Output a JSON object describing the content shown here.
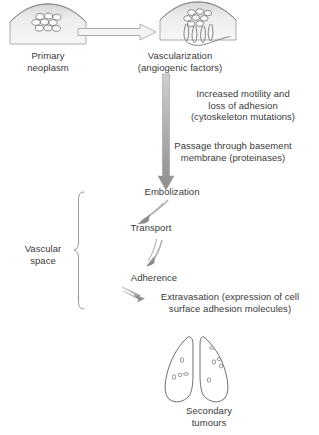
{
  "diagram": {
    "title_context": "Metastatic cascade",
    "nodes": [
      {
        "id": "primary-neoplasm",
        "label": "Primary\nneoplasm",
        "x": 8,
        "y": 50,
        "w": 80
      },
      {
        "id": "vascularization",
        "label": "Vascularization\n(angiogenic factors)",
        "x": 110,
        "y": 50,
        "w": 140
      },
      {
        "id": "increased-motility",
        "label": "Increased motility and\nloss of adhesion\n(cytoskeleton mutations)",
        "x": 168,
        "y": 88,
        "w": 150
      },
      {
        "id": "passage-basement",
        "label": "Passage through basement\nmembrane (proteinases)",
        "x": 148,
        "y": 140,
        "w": 170
      },
      {
        "id": "embolization",
        "label": "Embolization",
        "x": 122,
        "y": 186,
        "w": 100
      },
      {
        "id": "transport",
        "label": "Transport",
        "x": 110,
        "y": 222,
        "w": 82
      },
      {
        "id": "vascular-space",
        "label": "Vascular\nspace",
        "x": 12,
        "y": 243,
        "w": 62
      },
      {
        "id": "adherence",
        "label": "Adherence",
        "x": 112,
        "y": 272,
        "w": 84
      },
      {
        "id": "extravasation",
        "label": "Extravasation (expression of cell\nsurface adhesion molecules)",
        "x": 142,
        "y": 291,
        "w": 176
      },
      {
        "id": "secondary-tumours",
        "label": "Secondary\ntumours",
        "x": 166,
        "y": 405,
        "w": 86
      }
    ],
    "icons": {
      "primary_tumour_mound": "tumour-mound-icon",
      "vascularized_mound": "vascularized-tumour-icon",
      "lungs": "lungs-icon",
      "block_arrow": "block-arrow-right-icon",
      "gradient_arrow": "gradient-arrow-down-icon",
      "curved_arrow": "curved-arrow-icon",
      "brace": "curly-brace-icon"
    },
    "colors": {
      "text": "#3a3a3a",
      "outline": "#6b6b6b",
      "arrow_gray": "#8f8f8f",
      "arrow_light": "#b8b8b8",
      "tissue_fill_light": "#f2f2f2",
      "tissue_fill_dark": "#c9c9c9",
      "background": "#ffffff"
    },
    "counts": {
      "primary_cells": 9,
      "vascularized_cells": 8,
      "left_lung_deposits": 4,
      "right_lung_deposits": 5
    }
  }
}
